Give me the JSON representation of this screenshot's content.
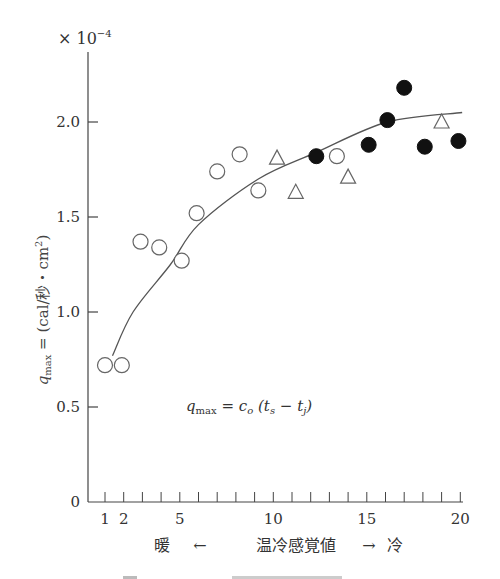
{
  "chart_data": {
    "type": "scatter",
    "title": "",
    "multiplier_label": "×10⁻⁴",
    "xlabel": "暖 ← 温冷感覚値 → 冷",
    "xlabel_parts": {
      "left": "暖",
      "left_arrow": "←",
      "center": "温冷感覚値",
      "right_arrow": "→",
      "right": "冷"
    },
    "ylabel": "q_max = (cal/秒・cm²)",
    "xlim": [
      1,
      20
    ],
    "ylim": [
      0,
      2.3
    ],
    "x_ticks": [
      1,
      2,
      3,
      4,
      5,
      6,
      7,
      8,
      9,
      10,
      11,
      12,
      13,
      14,
      15,
      16,
      17,
      18,
      19,
      20
    ],
    "x_tick_labels": [
      {
        "value": 1,
        "label": "1"
      },
      {
        "value": 2,
        "label": "2"
      },
      {
        "value": 5,
        "label": "5"
      },
      {
        "value": 10,
        "label": "10"
      },
      {
        "value": 15,
        "label": "15"
      },
      {
        "value": 20,
        "label": "20"
      }
    ],
    "y_ticks": [
      {
        "value": 0,
        "label": "0"
      },
      {
        "value": 0.5,
        "label": "0.5"
      },
      {
        "value": 1.0,
        "label": "1.0"
      },
      {
        "value": 1.5,
        "label": "1.5"
      },
      {
        "value": 2.0,
        "label": "2.0"
      }
    ],
    "grid": false,
    "series": [
      {
        "name": "open-circle",
        "marker": "circle-open",
        "points": [
          [
            1.0,
            0.72
          ],
          [
            1.9,
            0.72
          ],
          [
            2.9,
            1.37
          ],
          [
            3.9,
            1.34
          ],
          [
            5.1,
            1.27
          ],
          [
            5.9,
            1.52
          ],
          [
            7.0,
            1.74
          ],
          [
            8.2,
            1.83
          ],
          [
            9.2,
            1.64
          ],
          [
            13.4,
            1.82
          ]
        ]
      },
      {
        "name": "triangle",
        "marker": "triangle-open",
        "points": [
          [
            10.2,
            1.81
          ],
          [
            11.2,
            1.63
          ],
          [
            14.0,
            1.71
          ],
          [
            19.0,
            2.0
          ]
        ]
      },
      {
        "name": "filled-circle",
        "marker": "circle-filled",
        "points": [
          [
            12.3,
            1.82
          ],
          [
            15.1,
            1.88
          ],
          [
            16.1,
            2.01
          ],
          [
            17.0,
            2.18
          ],
          [
            18.1,
            1.87
          ],
          [
            19.9,
            1.9
          ]
        ]
      }
    ],
    "fit_curve": {
      "name": "q_max = c_o(t_s - t_j)",
      "points": [
        [
          1.4,
          0.77
        ],
        [
          2.5,
          1.0
        ],
        [
          4.5,
          1.25
        ],
        [
          6.0,
          1.46
        ],
        [
          9.2,
          1.7
        ],
        [
          12.3,
          1.84
        ],
        [
          16.1,
          2.0
        ],
        [
          20.1,
          2.05
        ]
      ]
    },
    "annotations": [
      {
        "text": "q_max = c_o (t_s − t_j)",
        "x": 5,
        "y": 0.5
      }
    ]
  },
  "labels": {
    "multiplier": "× 10",
    "multiplier_exp": "−4",
    "ylabel_q": "q",
    "ylabel_sub": "max",
    "ylabel_rest": " = (cal/秒・cm",
    "ylabel_sup": "2",
    "ylabel_close": ")",
    "formula_q": "q",
    "formula_sub": "max",
    "formula_eq": " = c",
    "formula_o": "o",
    "formula_paren": " (t",
    "formula_s": "s",
    "formula_minus": " − t",
    "formula_j": "j",
    "formula_close": ")",
    "xlabel_left": "暖",
    "xlabel_left_arrow": "←",
    "xlabel_center": "温冷感覚値",
    "xlabel_right_arrow": "→",
    "xlabel_right": "冷"
  }
}
